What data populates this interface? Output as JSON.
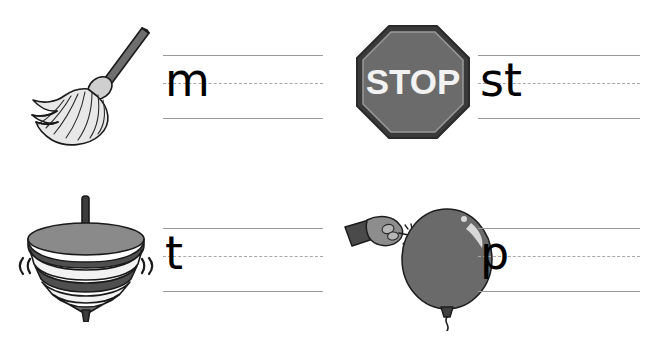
{
  "worksheet": {
    "title": "Beginning sounds handwriting practice worksheet",
    "background_color": "#ffffff",
    "rule_color": "#9b9b9b",
    "dashed_rule_color": "#a8a8a8",
    "letter_color": "#000000",
    "columns": 2,
    "rows": 2
  },
  "items": [
    {
      "id": "mop",
      "picture_name": "mop-illustration",
      "picture_alt": "mop",
      "letters": "m",
      "position": "top-left",
      "colors": {
        "handle": "#6e6e6e",
        "handle_dark": "#4a4a4a",
        "head_light": "#e8e8e8",
        "outline": "#1a1a1a"
      }
    },
    {
      "id": "stop-sign",
      "picture_name": "stop-sign-illustration",
      "picture_alt": "stop sign",
      "sign_text": "STOP",
      "letters": "st",
      "position": "top-right",
      "colors": {
        "face": "#6b6b6b",
        "border": "#3a3a3a",
        "text": "#f2f2f2",
        "outline": "#2a2a2a"
      }
    },
    {
      "id": "spinning-top",
      "picture_name": "spinning-top-illustration",
      "picture_alt": "spinning top",
      "motion_left": "((",
      "motion_right": "))",
      "letters": "t",
      "position": "bottom-left",
      "colors": {
        "dome": "#7d7d7d",
        "dome_dark": "#474747",
        "band_dark": "#4f4f4f",
        "band_light": "#f2f2f2",
        "stem": "#3c3c3c",
        "outline": "#1a1a1a"
      }
    },
    {
      "id": "balloon",
      "picture_name": "balloon-illustration",
      "picture_alt": "hand popping a balloon with a pin",
      "letters": "p",
      "position": "bottom-right",
      "colors": {
        "balloon": "#6a6a6a",
        "balloon_dark": "#4e4e4e",
        "highlight": "#d8d8d8",
        "sleeve": "#4a4a4a",
        "hand": "#8d8d8d",
        "outline": "#1c1c1c"
      }
    }
  ]
}
